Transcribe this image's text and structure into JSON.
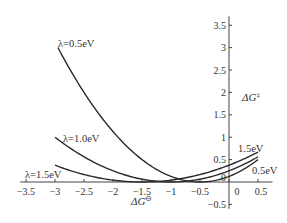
{
  "chart_data": {
    "type": "line",
    "title": "",
    "xlabel": "ΔG⊖",
    "ylabel": "ΔG‡",
    "xlim": [
      -3.6,
      0.75
    ],
    "ylim": [
      -0.6,
      3.7
    ],
    "grid": false,
    "legend": "inline labels",
    "x_ticks": [
      -3.5,
      -3,
      -2.5,
      -2,
      -1.5,
      -1,
      -0.5,
      0,
      0.5
    ],
    "x_tick_labels": [
      "−3.5",
      "−3",
      "−2.5",
      "−2",
      "−1.5",
      "−1",
      "−0.5",
      "0",
      "0.5"
    ],
    "y_ticks": [
      -0.5,
      0,
      0.5,
      1,
      1.5,
      2,
      2.5,
      3,
      3.5
    ],
    "y_tick_labels": [
      "−0.5",
      "0",
      "0.5",
      "1",
      "1.5",
      "2",
      "2.5",
      "3",
      "3.5"
    ],
    "formula": "ΔG‡ = (λ + ΔG⊖)² / (4λ)",
    "x": [
      -3.0,
      -2.5,
      -2.0,
      -1.5,
      -1.0,
      -0.5,
      0.0,
      0.5
    ],
    "series": [
      {
        "name": "λ=0.5eV",
        "lambda": 0.5,
        "x_start": -2.95,
        "values": [
          3.125,
          2.0,
          1.125,
          0.5,
          0.125,
          0.0,
          0.125,
          0.5
        ]
      },
      {
        "name": "λ=1.0eV",
        "lambda": 1.0,
        "x_start": -3.0,
        "values": [
          1.0,
          0.5625,
          0.25,
          0.0625,
          0.0,
          0.0625,
          0.25,
          0.5625
        ]
      },
      {
        "name": "λ=1.5eV",
        "lambda": 1.5,
        "x_start": -3.0,
        "values": [
          0.375,
          0.1667,
          0.0417,
          0.0,
          0.0417,
          0.1667,
          0.375,
          0.6667
        ]
      }
    ],
    "annotations": [
      {
        "text": "λ=0.5eV",
        "near": [
          -2.9,
          3.1
        ]
      },
      {
        "text": "λ=1.0eV",
        "near": [
          -2.8,
          1.0
        ]
      },
      {
        "text": "λ=1.5eV",
        "near": [
          -3.5,
          0.2
        ]
      },
      {
        "text": "1.5eV",
        "near": [
          0.2,
          0.75
        ]
      },
      {
        "text": "0.5eV",
        "near": [
          0.45,
          0.25
        ]
      }
    ]
  },
  "labels": {
    "curve_05": "λ=0.5eV",
    "curve_10": "λ=1.0eV",
    "curve_15": "λ=1.5eV",
    "right_15": "1.5eV",
    "right_05": "0.5eV",
    "xlabel_main": "ΔG",
    "xlabel_sup": "⊖",
    "ylabel_main": "ΔG",
    "ylabel_sup": "‡"
  }
}
